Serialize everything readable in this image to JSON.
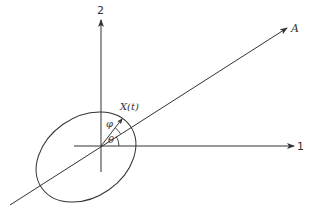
{
  "diagram": {
    "type": "coordinate-geometry",
    "axes": {
      "horizontal": {
        "label": "1"
      },
      "vertical": {
        "label": "2"
      }
    },
    "ray": {
      "label": "A"
    },
    "vector": {
      "label": "X(t)"
    },
    "angles": {
      "theta": "θ",
      "phi": "φ"
    },
    "shape": "tilted ellipse centered near origin",
    "colors": {
      "stroke": "#333333",
      "background": "#ffffff"
    }
  }
}
